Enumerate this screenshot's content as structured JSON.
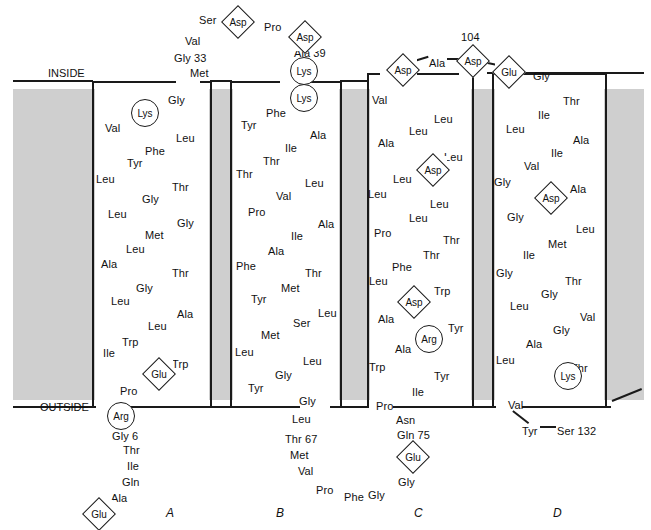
{
  "figure": {
    "title_inside": "INSIDE",
    "title_outside": "OUTSIDE",
    "membrane_color": "#cfcfcf",
    "line_color": "#1a1a1a"
  },
  "column_labels": [
    {
      "label": "A",
      "x": 166,
      "y": 506
    },
    {
      "label": "B",
      "x": 276,
      "y": 506
    },
    {
      "label": "C",
      "x": 414,
      "y": 506
    },
    {
      "label": "D",
      "x": 553,
      "y": 506
    }
  ],
  "markers": [
    {
      "name": "asp-top-1",
      "label": "Asp",
      "shape": "diamond",
      "x": 224,
      "y": 8
    },
    {
      "name": "asp-top-2",
      "label": "Asp",
      "shape": "diamond",
      "x": 291,
      "y": 23
    },
    {
      "name": "lys-b-1",
      "label": "Lys",
      "shape": "circle",
      "x": 290,
      "y": 57
    },
    {
      "name": "lys-b-2",
      "label": "Lys",
      "shape": "circle",
      "x": 290,
      "y": 84
    },
    {
      "name": "lys-a-1",
      "label": "Lys",
      "shape": "circle",
      "x": 131,
      "y": 99
    },
    {
      "name": "asp-c-top",
      "label": "Asp",
      "shape": "diamond",
      "x": 389,
      "y": 56
    },
    {
      "name": "asp-104",
      "label": "Asp",
      "shape": "diamond",
      "x": 459,
      "y": 47
    },
    {
      "name": "glu-d-top",
      "label": "Glu",
      "shape": "diamond",
      "x": 495,
      "y": 58
    },
    {
      "name": "asp-c-mid",
      "label": "Asp",
      "shape": "diamond",
      "x": 419,
      "y": 156
    },
    {
      "name": "asp-d-mid",
      "label": "Asp",
      "shape": "diamond",
      "x": 537,
      "y": 184
    },
    {
      "name": "asp-c-low",
      "label": "Asp",
      "shape": "diamond",
      "x": 400,
      "y": 288
    },
    {
      "name": "arg-c",
      "label": "Arg",
      "shape": "circle",
      "x": 415,
      "y": 325
    },
    {
      "name": "lys-d",
      "label": "Lys",
      "shape": "circle",
      "x": 554,
      "y": 362
    },
    {
      "name": "glu-a-low",
      "label": "Glu",
      "shape": "diamond",
      "x": 145,
      "y": 360
    },
    {
      "name": "arg-a",
      "label": "Arg",
      "shape": "circle",
      "x": 107,
      "y": 402
    },
    {
      "name": "glu-a-term",
      "label": "Glu",
      "shape": "diamond",
      "x": 85,
      "y": 500
    },
    {
      "name": "glu-c-term",
      "label": "Glu",
      "shape": "diamond",
      "x": 399,
      "y": 443
    }
  ],
  "annotations": [
    {
      "name": "label-104",
      "label": "104",
      "x": 461,
      "y": 32
    },
    {
      "name": "label-ala-39",
      "label": "Ala 39",
      "x": 294,
      "y": 48
    },
    {
      "name": "label-gly-33",
      "label": "Gly 33",
      "x": 174,
      "y": 53
    },
    {
      "name": "label-gly-6",
      "label": "Gly 6",
      "x": 112,
      "y": 431
    },
    {
      "name": "label-thr-67",
      "label": "Thr 67",
      "x": 285,
      "y": 434
    },
    {
      "name": "label-gln-75",
      "label": "Gln 75",
      "x": 397,
      "y": 430
    },
    {
      "name": "label-ser-132",
      "label": "Ser 132",
      "x": 557,
      "y": 426
    },
    {
      "name": "label-ala-link",
      "label": "Ala",
      "x": 429,
      "y": 58
    },
    {
      "name": "label-tyr-132",
      "label": "Tyr",
      "x": 522,
      "y": 426
    }
  ],
  "free_residues": [
    {
      "label": "Ser",
      "x": 199,
      "y": 15
    },
    {
      "label": "Pro",
      "x": 264,
      "y": 22
    },
    {
      "label": "Val",
      "x": 185,
      "y": 36
    },
    {
      "label": "Met",
      "x": 190,
      "y": 68
    },
    {
      "label": "Gly",
      "x": 533,
      "y": 71
    },
    {
      "label": "Thr",
      "x": 123,
      "y": 445
    },
    {
      "label": "Ile",
      "x": 127,
      "y": 461
    },
    {
      "label": "Gln",
      "x": 122,
      "y": 477
    },
    {
      "label": "Ala",
      "x": 111,
      "y": 493
    },
    {
      "label": "Leu",
      "x": 292,
      "y": 414
    },
    {
      "label": "Met",
      "x": 290,
      "y": 450
    },
    {
      "label": "Val",
      "x": 298,
      "y": 466
    },
    {
      "label": "Pro",
      "x": 316,
      "y": 485
    },
    {
      "label": "Phe",
      "x": 344,
      "y": 492
    },
    {
      "label": "Gly",
      "x": 368,
      "y": 490
    },
    {
      "label": "Asn",
      "x": 396,
      "y": 415
    },
    {
      "label": "Gly",
      "x": 398,
      "y": 477
    },
    {
      "label": "Pro",
      "x": 376,
      "y": 401
    },
    {
      "label": "Gly",
      "x": 299,
      "y": 396
    }
  ],
  "helices": [
    {
      "name": "helix-a",
      "label": "A",
      "x": 92,
      "y": 81,
      "w": 120,
      "h": 327,
      "residues": [
        {
          "label": "Gly",
          "x": 168,
          "y": 95
        },
        {
          "label": "Val",
          "x": 105,
          "y": 123
        },
        {
          "label": "Leu",
          "x": 176,
          "y": 133
        },
        {
          "label": "Phe",
          "x": 145,
          "y": 146
        },
        {
          "label": "Tyr",
          "x": 127,
          "y": 158
        },
        {
          "label": "Leu",
          "x": 96,
          "y": 174
        },
        {
          "label": "Thr",
          "x": 172,
          "y": 182
        },
        {
          "label": "Gly",
          "x": 142,
          "y": 194
        },
        {
          "label": "Leu",
          "x": 108,
          "y": 209
        },
        {
          "label": "Gly",
          "x": 177,
          "y": 218
        },
        {
          "label": "Met",
          "x": 145,
          "y": 230
        },
        {
          "label": "Leu",
          "x": 126,
          "y": 244
        },
        {
          "label": "Ala",
          "x": 101,
          "y": 259
        },
        {
          "label": "Thr",
          "x": 172,
          "y": 268
        },
        {
          "label": "Gly",
          "x": 136,
          "y": 283
        },
        {
          "label": "Leu",
          "x": 111,
          "y": 296
        },
        {
          "label": "Ala",
          "x": 177,
          "y": 309
        },
        {
          "label": "Leu",
          "x": 148,
          "y": 321
        },
        {
          "label": "Trp",
          "x": 122,
          "y": 337
        },
        {
          "label": "Ile",
          "x": 103,
          "y": 348
        },
        {
          "label": "Trp",
          "x": 172,
          "y": 359
        },
        {
          "label": "Pro",
          "x": 120,
          "y": 386
        }
      ]
    },
    {
      "name": "helix-b",
      "label": "B",
      "x": 230,
      "y": 81,
      "w": 112,
      "h": 327,
      "residues": [
        {
          "label": "Phe",
          "x": 266,
          "y": 108
        },
        {
          "label": "Tyr",
          "x": 241,
          "y": 120
        },
        {
          "label": "Ala",
          "x": 310,
          "y": 130
        },
        {
          "label": "Ile",
          "x": 285,
          "y": 143
        },
        {
          "label": "Thr",
          "x": 263,
          "y": 156
        },
        {
          "label": "Thr",
          "x": 236,
          "y": 169
        },
        {
          "label": "Leu",
          "x": 305,
          "y": 178
        },
        {
          "label": "Val",
          "x": 276,
          "y": 191
        },
        {
          "label": "Pro",
          "x": 248,
          "y": 207
        },
        {
          "label": "Ala",
          "x": 318,
          "y": 219
        },
        {
          "label": "Ile",
          "x": 291,
          "y": 231
        },
        {
          "label": "Ala",
          "x": 268,
          "y": 246
        },
        {
          "label": "Phe",
          "x": 236,
          "y": 261
        },
        {
          "label": "Thr",
          "x": 305,
          "y": 268
        },
        {
          "label": "Met",
          "x": 281,
          "y": 283
        },
        {
          "label": "Tyr",
          "x": 251,
          "y": 294
        },
        {
          "label": "Leu",
          "x": 318,
          "y": 308
        },
        {
          "label": "Ser",
          "x": 293,
          "y": 318
        },
        {
          "label": "Met",
          "x": 261,
          "y": 330
        },
        {
          "label": "Leu",
          "x": 235,
          "y": 347
        },
        {
          "label": "Leu",
          "x": 303,
          "y": 356
        },
        {
          "label": "Gly",
          "x": 275,
          "y": 370
        },
        {
          "label": "Tyr",
          "x": 248,
          "y": 383
        }
      ]
    },
    {
      "name": "helix-c",
      "label": "C",
      "x": 367,
      "y": 73,
      "w": 107,
      "h": 335,
      "residues": [
        {
          "label": "Val",
          "x": 372,
          "y": 95
        },
        {
          "label": "Leu",
          "x": 434,
          "y": 114
        },
        {
          "label": "Leu",
          "x": 409,
          "y": 126
        },
        {
          "label": "Ala",
          "x": 378,
          "y": 138
        },
        {
          "label": "Leu",
          "x": 444,
          "y": 152
        },
        {
          "label": "Leu",
          "x": 393,
          "y": 174
        },
        {
          "label": "Leu",
          "x": 368,
          "y": 189
        },
        {
          "label": "Leu",
          "x": 430,
          "y": 199
        },
        {
          "label": "Leu",
          "x": 409,
          "y": 213
        },
        {
          "label": "Pro",
          "x": 374,
          "y": 228
        },
        {
          "label": "Thr",
          "x": 443,
          "y": 235
        },
        {
          "label": "Thr",
          "x": 423,
          "y": 250
        },
        {
          "label": "Phe",
          "x": 392,
          "y": 262
        },
        {
          "label": "Leu",
          "x": 369,
          "y": 276
        },
        {
          "label": "Trp",
          "x": 434,
          "y": 286
        },
        {
          "label": "Ala",
          "x": 378,
          "y": 314
        },
        {
          "label": "Tyr",
          "x": 448,
          "y": 323
        },
        {
          "label": "Ala",
          "x": 395,
          "y": 344
        },
        {
          "label": "Trp",
          "x": 369,
          "y": 362
        },
        {
          "label": "Tyr",
          "x": 434,
          "y": 371
        },
        {
          "label": "Ile",
          "x": 412,
          "y": 387
        }
      ]
    },
    {
      "name": "helix-d",
      "label": "D",
      "x": 492,
      "y": 81,
      "w": 115,
      "h": 327,
      "residues": [
        {
          "label": "Thr",
          "x": 563,
          "y": 96
        },
        {
          "label": "Ile",
          "x": 538,
          "y": 110
        },
        {
          "label": "Leu",
          "x": 506,
          "y": 124
        },
        {
          "label": "Ala",
          "x": 573,
          "y": 135
        },
        {
          "label": "Ile",
          "x": 551,
          "y": 148
        },
        {
          "label": "Val",
          "x": 524,
          "y": 161
        },
        {
          "label": "Gly",
          "x": 494,
          "y": 177
        },
        {
          "label": "Ala",
          "x": 570,
          "y": 184
        },
        {
          "label": "Gly",
          "x": 507,
          "y": 212
        },
        {
          "label": "Leu",
          "x": 576,
          "y": 224
        },
        {
          "label": "Met",
          "x": 548,
          "y": 239
        },
        {
          "label": "Ile",
          "x": 523,
          "y": 250
        },
        {
          "label": "Gly",
          "x": 496,
          "y": 268
        },
        {
          "label": "Thr",
          "x": 565,
          "y": 276
        },
        {
          "label": "Gly",
          "x": 541,
          "y": 289
        },
        {
          "label": "Leu",
          "x": 510,
          "y": 301
        },
        {
          "label": "Val",
          "x": 580,
          "y": 312
        },
        {
          "label": "Gly",
          "x": 553,
          "y": 325
        },
        {
          "label": "Ala",
          "x": 526,
          "y": 339
        },
        {
          "label": "Leu",
          "x": 496,
          "y": 355
        },
        {
          "label": "Thr",
          "x": 571,
          "y": 363
        },
        {
          "label": "Val",
          "x": 508,
          "y": 400
        }
      ]
    }
  ]
}
